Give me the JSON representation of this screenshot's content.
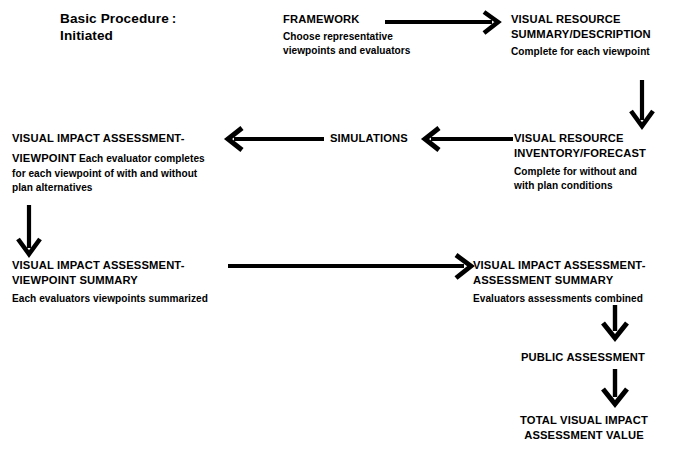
{
  "diagram": {
    "heading": {
      "line1": "Basic Procedure",
      "colon": ":",
      "line2": "Initiated"
    },
    "nodes": {
      "framework": {
        "title": "FRAMEWORK",
        "desc_line1": "Choose representative",
        "desc_line2": "viewpoints and evaluators"
      },
      "visual_resource_summary": {
        "title_line1": "VISUAL RESOURCE",
        "title_line2": "SUMMARY/DESCRIPTION",
        "desc_line1": "Complete for each viewpoint"
      },
      "visual_resource_inventory": {
        "title_line1": "VISUAL RESOURCE",
        "title_line2": "INVENTORY/FORECAST",
        "desc_line1": "Complete for without and",
        "desc_line2": "with plan conditions"
      },
      "simulations": {
        "title": "SIMULATIONS"
      },
      "via_viewpoint": {
        "title_line1": "VISUAL IMPACT ASSESSMENT-",
        "title_line2": "VIEWPOINT",
        "desc_inline": "Each evaluator completes",
        "desc_line2": "for each viewpoint of with and without",
        "desc_line3": "plan alternatives"
      },
      "via_viewpoint_summary": {
        "title_line1": "VISUAL IMPACT ASSESSMENT-",
        "title_line2": "VIEWPOINT SUMMARY",
        "desc_line1": "Each evaluators viewpoints summarized"
      },
      "via_assessment_summary": {
        "title_line1": "VISUAL IMPACT ASSESSMENT-",
        "title_line2": "ASSESSMENT SUMMARY",
        "desc_line1": "Evaluators assessments combined"
      },
      "public_assessment": {
        "title": "PUBLIC ASSESSMENT"
      },
      "total_value": {
        "title_line1": "TOTAL VISUAL IMPACT",
        "title_line2": "ASSESSMENT VALUE"
      }
    },
    "connectors": [
      {
        "name": "framework-to-summary",
        "direction": "right"
      },
      {
        "name": "summary-to-inventory",
        "direction": "down"
      },
      {
        "name": "inventory-to-simulations",
        "direction": "left"
      },
      {
        "name": "simulations-to-viewpoint",
        "direction": "left"
      },
      {
        "name": "viewpoint-to-viewpoint-summary",
        "direction": "down"
      },
      {
        "name": "viewpoint-summary-to-assessment-summary",
        "direction": "right"
      },
      {
        "name": "assessment-summary-to-public",
        "direction": "down"
      },
      {
        "name": "public-to-total-value",
        "direction": "down"
      }
    ],
    "colors": {
      "ink": "#000000",
      "background": "#ffffff"
    }
  }
}
